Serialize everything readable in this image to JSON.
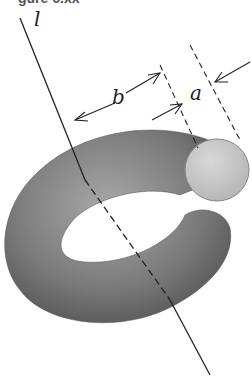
{
  "figure": {
    "caption_partial": "gure 6.xx",
    "labels": {
      "axis": "l",
      "major_radius": "b",
      "minor_radius": "a"
    },
    "colors": {
      "torus_dark": "#5e5e5e",
      "torus_mid": "#8a8a8a",
      "cross_section": "#c9c9c9",
      "line": "#222222"
    }
  }
}
